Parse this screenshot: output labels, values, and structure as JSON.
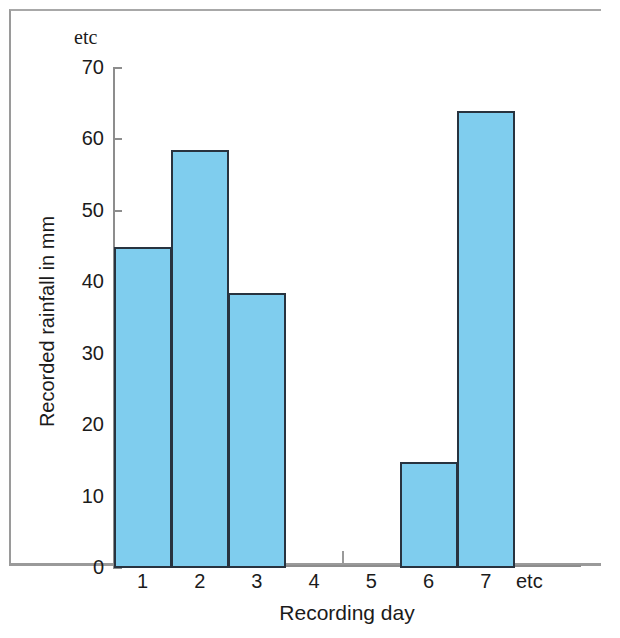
{
  "chart_data": {
    "type": "bar",
    "title": "",
    "xlabel": "Recording day",
    "ylabel": "Recorded rainfall in mm",
    "categories": [
      "1",
      "2",
      "3",
      "4",
      "5",
      "6",
      "7"
    ],
    "values": [
      45,
      58.5,
      38.5,
      0,
      0,
      14.8,
      64
    ],
    "ylim": [
      0,
      70
    ],
    "xlim": [
      0,
      7
    ],
    "y_ticks": [
      "0",
      "10",
      "20",
      "30",
      "40",
      "50",
      "60",
      "70"
    ],
    "y_tick_values": [
      0,
      10,
      20,
      30,
      40,
      50,
      60,
      70
    ],
    "x_ticks": [
      "1",
      "2",
      "3",
      "4",
      "5",
      "6",
      "7"
    ],
    "y_axis_continuation": "etc",
    "x_axis_continuation": "etc",
    "grid": false,
    "legend": false,
    "bar_fill_color": "#7fcdee",
    "bar_edge_color": "#28333f",
    "axis_color": "#8d8d8d",
    "frame_color": "#9a9a9a",
    "background_color": "#ffffff"
  },
  "axes": {
    "y_title": "Recorded rainfall in mm",
    "x_title": "Recording day",
    "y_etc": "etc",
    "x_etc": "etc",
    "y_labels": {
      "t0": "0",
      "t10": "10",
      "t20": "20",
      "t30": "30",
      "t40": "40",
      "t50": "50",
      "t60": "60",
      "t70": "70"
    },
    "x_labels": {
      "d1": "1",
      "d2": "2",
      "d3": "3",
      "d4": "4",
      "d5": "5",
      "d6": "6",
      "d7": "7"
    }
  }
}
